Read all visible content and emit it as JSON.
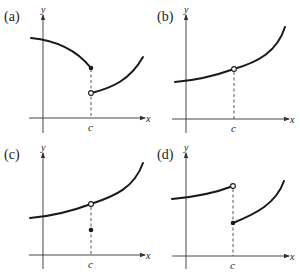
{
  "figure": {
    "panels": [
      {
        "label": "(a)",
        "x_axis": "x",
        "y_axis": "y",
        "c_label": "c",
        "description": "Jump discontinuity at c: left piece ends at filled dot (f(c) defined on upper piece), right piece starts at open dot below"
      },
      {
        "label": "(b)",
        "x_axis": "x",
        "y_axis": "y",
        "c_label": "c",
        "description": "Removable discontinuity: increasing curve with open dot (hole) at x = c, f(c) undefined"
      },
      {
        "label": "(c)",
        "x_axis": "x",
        "y_axis": "y",
        "c_label": "c",
        "description": "Removable discontinuity: increasing curve with open dot at x = c, f(c) is a filled dot below the curve"
      },
      {
        "label": "(d)",
        "x_axis": "x",
        "y_axis": "y",
        "c_label": "c",
        "description": "Jump discontinuity: left piece ends with open dot at c, right piece starts at filled dot lower"
      }
    ],
    "colors": {
      "ink": "#1a1a1a",
      "background": "#ffffff"
    }
  }
}
